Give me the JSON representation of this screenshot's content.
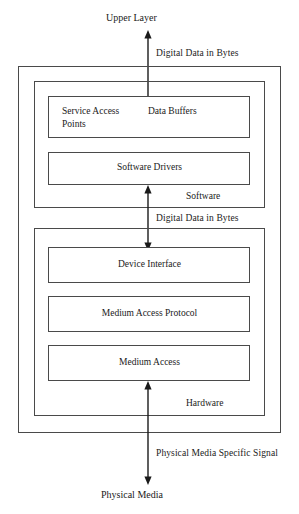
{
  "diagram": {
    "endpoints": {
      "top": "Upper Layer",
      "bottom": "Physical Media"
    },
    "arrows": [
      {
        "id": "upper-to-software",
        "label": "Digital Data in Bytes",
        "direction": "bidirectional"
      },
      {
        "id": "software-to-hardware",
        "label": "Digital Data in Bytes",
        "direction": "bidirectional"
      },
      {
        "id": "hardware-to-media",
        "label": "Physical Media Specific Signal",
        "direction": "bidirectional"
      }
    ],
    "sections": [
      {
        "id": "software",
        "label": "Software",
        "boxes": [
          {
            "id": "service-access-points",
            "label": "Service Access\nPoints",
            "align": "left"
          },
          {
            "id": "data-buffers",
            "label": "Data Buffers",
            "align": "left"
          },
          {
            "id": "software-drivers",
            "label": "Software Drivers",
            "align": "center"
          }
        ]
      },
      {
        "id": "hardware",
        "label": "Hardware",
        "boxes": [
          {
            "id": "device-interface",
            "label": "Device Interface",
            "align": "center"
          },
          {
            "id": "medium-access-protocol",
            "label": "Medium Access Protocol",
            "align": "center"
          },
          {
            "id": "medium-access",
            "label": "Medium Access",
            "align": "center"
          }
        ]
      }
    ],
    "colors": {
      "stroke": "#4a4a4a",
      "text": "#1a1a1a",
      "background": "#ffffff"
    }
  }
}
